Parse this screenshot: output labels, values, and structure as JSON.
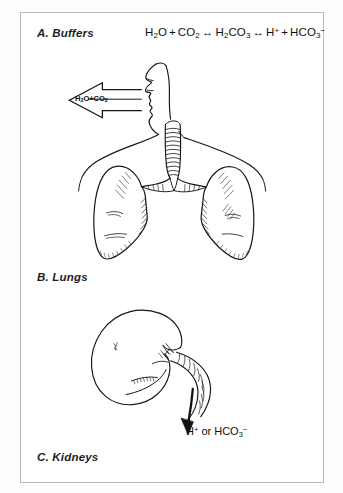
{
  "figure": {
    "title_implicit": "Regulation of acid-base balance",
    "background_color": "#ffffff",
    "border_color": "#b9b9bd",
    "ink_color": "#111111"
  },
  "panels": [
    {
      "id": "buffers",
      "label": "A. Buffers",
      "equation": {
        "parts": [
          {
            "formula": "H",
            "sub": "2",
            "tail": "O"
          },
          {
            "op": "+"
          },
          {
            "formula": "CO",
            "sub": "2"
          },
          {
            "op": "↔"
          },
          {
            "formula": "H",
            "sub": "2",
            "tail": "CO",
            "sub2": "3"
          },
          {
            "op": "↔"
          },
          {
            "formula": "H",
            "sup": "+"
          },
          {
            "op": "+"
          },
          {
            "formula": "HCO",
            "sub": "3",
            "sup": "−"
          }
        ],
        "plain_text": "H2O + CO2 ↔ H2CO3 ↔ H+ + HCO3−"
      }
    },
    {
      "id": "lungs",
      "label": "B. Lungs",
      "exhale_arrow": {
        "direction": "left",
        "label_plain": "H2O+CO2",
        "label_lead": "H",
        "label_sub1": "2",
        "label_mid": "O+CO",
        "label_sub2": "2"
      },
      "anatomy": [
        "head-profile",
        "trachea",
        "bronchi",
        "left-lung",
        "right-lung",
        "shoulders"
      ]
    },
    {
      "id": "kidneys",
      "label": "C. Kidneys",
      "output_label": {
        "plain_text": "H+ or HCO3−",
        "ion_1": "H",
        "ion_1_sup": "+",
        "conjunction": "or",
        "ion_2": "HCO",
        "ion_2_sub": "3",
        "ion_2_sup": "−"
      },
      "anatomy": [
        "kidney-body",
        "renal-hilum",
        "renal-vessels",
        "ureter",
        "excretion-arrow"
      ]
    }
  ]
}
